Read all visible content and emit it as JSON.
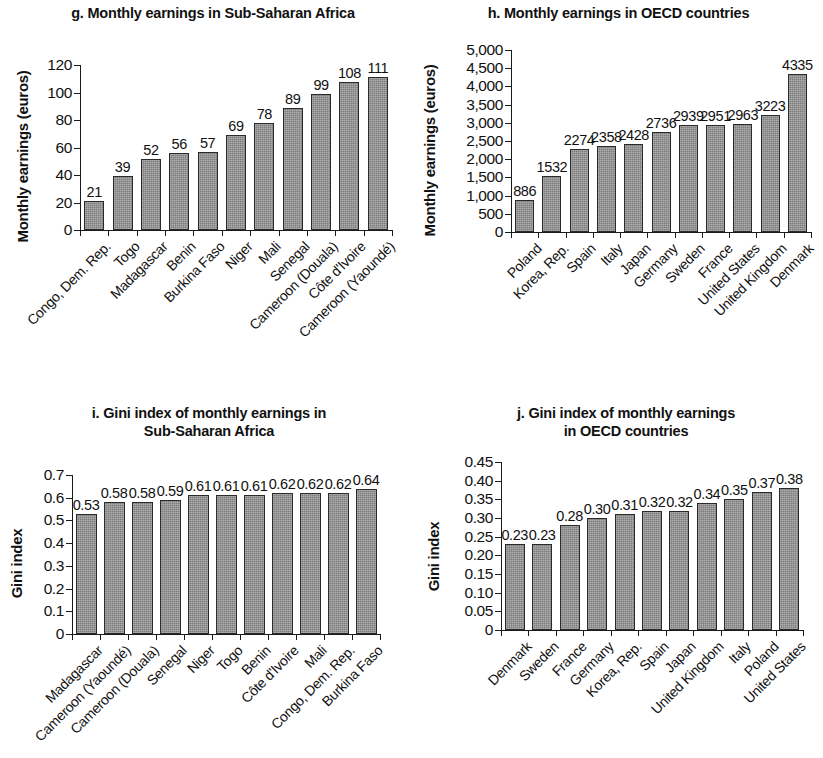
{
  "figure": {
    "background_color": "#ffffff",
    "bar_fill_color": "#8d8d8d",
    "bar_border_color": "#2a2a2a",
    "text_color": "#111111"
  },
  "chart_data": [
    {
      "id": "g",
      "type": "bar",
      "title": "g. Monthly earnings in Sub-Saharan Africa",
      "xlabel": "",
      "ylabel": "Monthly earnings (euros)",
      "ylim": [
        0,
        120
      ],
      "yticks": [
        0,
        20,
        40,
        60,
        80,
        100,
        120
      ],
      "ytick_labels": [
        "0",
        "20",
        "40",
        "60",
        "80",
        "100",
        "120"
      ],
      "grid": false,
      "legend": "none",
      "categories": [
        "Congo, Dem. Rep.",
        "Togo",
        "Madagascar",
        "Benin",
        "Burkina Faso",
        "Niger",
        "Mali",
        "Senegal",
        "Cameroon (Douala)",
        "Côte d'Ivoire",
        "Cameroon (Yaoundé)"
      ],
      "values": [
        21,
        39,
        52,
        56,
        57,
        69,
        78,
        89,
        99,
        108,
        111
      ],
      "data_labels": [
        "21",
        "39",
        "52",
        "56",
        "57",
        "69",
        "78",
        "89",
        "99",
        "108",
        "111"
      ]
    },
    {
      "id": "h",
      "type": "bar",
      "title": "h. Monthly earnings in OECD countries",
      "xlabel": "",
      "ylabel": "Monthly earnings (euros)",
      "ylim": [
        0,
        5000
      ],
      "yticks": [
        0,
        500,
        1000,
        1500,
        2000,
        2500,
        3000,
        3500,
        4000,
        4500,
        5000
      ],
      "ytick_labels": [
        "0",
        "500",
        "1,000",
        "1,500",
        "2,000",
        "2,500",
        "3,000",
        "3,500",
        "4,000",
        "4,500",
        "5,000"
      ],
      "grid": false,
      "legend": "none",
      "categories": [
        "Poland",
        "Korea, Rep.",
        "Spain",
        "Italy",
        "Japan",
        "Germany",
        "Sweden",
        "France",
        "United States",
        "United Kingdom",
        "Denmark"
      ],
      "values": [
        886,
        1532,
        2274,
        2358,
        2428,
        2736,
        2939,
        2951,
        2963,
        3223,
        4335
      ],
      "data_labels": [
        "886",
        "1532",
        "2274",
        "2358",
        "2428",
        "2736",
        "2939",
        "2951",
        "2963",
        "3223",
        "4335"
      ]
    },
    {
      "id": "i",
      "type": "bar",
      "title": "i. Gini index of monthly earnings in\nSub-Saharan Africa",
      "xlabel": "",
      "ylabel": "Gini index",
      "ylim": [
        0,
        0.7
      ],
      "yticks": [
        0,
        0.1,
        0.2,
        0.3,
        0.4,
        0.5,
        0.6,
        0.7
      ],
      "ytick_labels": [
        "0",
        "0.1",
        "0.2",
        "0.3",
        "0.4",
        "0.5",
        "0.6",
        "0.7"
      ],
      "grid": false,
      "legend": "none",
      "categories": [
        "Madagascar",
        "Cameroon (Yaoundé)",
        "Cameroon (Douala)",
        "Senegal",
        "Niger",
        "Togo",
        "Benin",
        "Côte d'Ivoire",
        "Mali",
        "Congo, Dem. Rep.",
        "Burkina Faso"
      ],
      "values": [
        0.53,
        0.58,
        0.58,
        0.59,
        0.61,
        0.61,
        0.61,
        0.62,
        0.62,
        0.62,
        0.64
      ],
      "data_labels": [
        "0.53",
        "0.58",
        "0.58",
        "0.59",
        "0.61",
        "0.61",
        "0.61",
        "0.62",
        "0.62",
        "0.62",
        "0.64"
      ]
    },
    {
      "id": "j",
      "type": "bar",
      "title": "j. Gini index of monthly earnings\nin OECD countries",
      "xlabel": "",
      "ylabel": "Gini index",
      "ylim": [
        0,
        0.45
      ],
      "yticks": [
        0,
        0.05,
        0.1,
        0.15,
        0.2,
        0.25,
        0.3,
        0.35,
        0.4,
        0.45
      ],
      "ytick_labels": [
        "0",
        "0.05",
        "0.10",
        "0.15",
        "0.20",
        "0.25",
        "0.30",
        "0.35",
        "0.40",
        "0.45"
      ],
      "grid": false,
      "legend": "none",
      "categories": [
        "Denmark",
        "Sweden",
        "France",
        "Germany",
        "Korea, Rep.",
        "Spain",
        "Japan",
        "United Kingdom",
        "Italy",
        "Poland",
        "United States"
      ],
      "values": [
        0.23,
        0.23,
        0.28,
        0.3,
        0.31,
        0.32,
        0.32,
        0.34,
        0.35,
        0.37,
        0.38
      ],
      "data_labels": [
        "0.23",
        "0.23",
        "0.28",
        "0.30",
        "0.31",
        "0.32",
        "0.32",
        "0.34",
        "0.35",
        "0.37",
        "0.38"
      ]
    }
  ]
}
